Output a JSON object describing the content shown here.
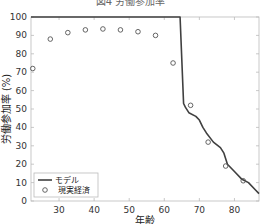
{
  "title": "図4 労働参加率",
  "chart_data": {
    "type": "line",
    "title": "図4 労働参加率",
    "xlabel": "年齢",
    "ylabel": "労働参加率 (%)",
    "xlim": [
      22,
      87
    ],
    "ylim": [
      0,
      100
    ],
    "xticks": [
      30,
      40,
      50,
      60,
      70,
      80
    ],
    "yticks": [
      0,
      10,
      20,
      30,
      40,
      50,
      60,
      70,
      80,
      90,
      100
    ],
    "grid": false,
    "legend_position": "lower left",
    "series": [
      {
        "name": "モデル",
        "style": "line",
        "color": "#404040",
        "x": [
          22,
          64.5,
          65.5,
          66,
          67,
          69,
          70,
          71,
          72,
          74,
          76,
          77,
          78,
          80,
          82,
          84,
          86,
          87
        ],
        "y": [
          100,
          100,
          53,
          51,
          48,
          46,
          44,
          40,
          37,
          32,
          29,
          26,
          20,
          16,
          12,
          10,
          6,
          4
        ]
      },
      {
        "name": "現実経済",
        "style": "marker-circle",
        "color": "#555555",
        "x": [
          22.5,
          27.5,
          32.5,
          37.5,
          42.5,
          47.5,
          52.5,
          57.5,
          62.5,
          67.5,
          72.5,
          77.5,
          82.5
        ],
        "y": [
          72,
          88,
          91.5,
          93,
          93.5,
          93,
          92,
          90,
          75,
          52,
          32,
          19,
          11
        ]
      }
    ]
  },
  "legend": {
    "items": [
      "モデル",
      "現実経済"
    ]
  }
}
